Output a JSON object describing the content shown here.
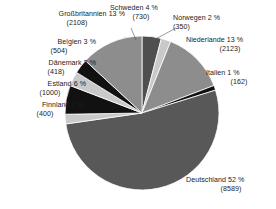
{
  "chart_data": {
    "type": "pie",
    "title": "",
    "subtitle": "",
    "xlabel": "",
    "ylabel": "",
    "legend_position": "callout-labels",
    "grid": false,
    "total": 16484,
    "value_unit": "",
    "categories": [
      "Schweden",
      "Norwegen",
      "Niederlande",
      "Italien",
      "Deutschland",
      "Finnland",
      "Estland",
      "Dänemark",
      "Belgien",
      "Großbritannien"
    ],
    "values": [
      730,
      350,
      2123,
      162,
      8589,
      400,
      1000,
      418,
      504,
      2108
    ],
    "percents": [
      4,
      2,
      13,
      1,
      52,
      2,
      6,
      3,
      3,
      13
    ],
    "colors": [
      "#4f4f4f",
      "#c9c9c9",
      "#8d8d8d",
      "#111111",
      "#585858",
      "#c9c9c9",
      "#111111",
      "#c9c9c9",
      "#111111",
      "#8d8d8d"
    ],
    "slices": [
      {
        "name": "Schweden",
        "percent": 4,
        "value": 730,
        "label": "Schweden 4 %",
        "value_label": "(730)",
        "color": "#4f4f4f"
      },
      {
        "name": "Norwegen",
        "percent": 2,
        "value": 350,
        "label": "Norwegen 2 %",
        "value_label": "(350)",
        "color": "#c9c9c9"
      },
      {
        "name": "Niederlande",
        "percent": 13,
        "value": 2123,
        "label": "Niederlande 13 %",
        "value_label": "(2123)",
        "color": "#8d8d8d"
      },
      {
        "name": "Italien",
        "percent": 1,
        "value": 162,
        "label": "Italien 1 %",
        "value_label": "(162)",
        "color": "#111111"
      },
      {
        "name": "Deutschland",
        "percent": 52,
        "value": 8589,
        "label": "Deutschland 52 %",
        "value_label": "(8589)",
        "color": "#585858"
      },
      {
        "name": "Finnland",
        "percent": 2,
        "value": 400,
        "label": "Finnland 2 %",
        "value_label": "(400)",
        "color": "#c9c9c9"
      },
      {
        "name": "Estland",
        "percent": 6,
        "value": 1000,
        "label": "Estland 6 %",
        "value_label": "(1000)",
        "color": "#111111"
      },
      {
        "name": "Dänemark",
        "percent": 3,
        "value": 418,
        "label": "Dänemark 3 %",
        "value_label": "(418)",
        "color": "#c9c9c9"
      },
      {
        "name": "Belgien",
        "percent": 3,
        "value": 504,
        "label": "Belgien 3 %",
        "value_label": "(504)",
        "color": "#111111"
      },
      {
        "name": "Großbritannien",
        "percent": 13,
        "value": 2108,
        "label": "Großbritannien 13 %",
        "value_label": "(2108)",
        "color": "#8d8d8d"
      }
    ]
  },
  "labels": {
    "grossbritannien": {
      "name": "Großbritannien 13 %",
      "value": "(2108)"
    },
    "belgien": {
      "name": "Belgien 3 %",
      "value": "(504)"
    },
    "daenemark": {
      "name": "Dänemark 3 %",
      "value": "(418)"
    },
    "estland": {
      "name": "Estland 6 %",
      "value": "(1000)"
    },
    "finnland": {
      "name": "Finnland 2 %",
      "value": "(400)"
    },
    "schweden": {
      "name": "Schweden 4 %",
      "value": "(730)"
    },
    "norwegen": {
      "name": "Norwegen 2 %",
      "value": "(350)"
    },
    "niederlande": {
      "name": "Niederlande 13 %",
      "value": "(2123)"
    },
    "italien": {
      "name": "Italien 1 %",
      "value": "(162)"
    },
    "deutschland": {
      "name": "Deutschland 52 %",
      "value": "(8589)"
    }
  }
}
